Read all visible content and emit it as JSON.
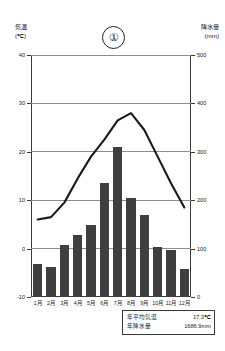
{
  "header": {
    "left_title": "気温",
    "left_unit": "(℃)",
    "right_title": "降水量",
    "right_unit": "(mm)",
    "panel_number": "①"
  },
  "summary": {
    "avg_temp_label": "年平均気温",
    "avg_temp_value": "17.3℃",
    "total_precip_label": "年降水量",
    "total_precip_value": "1686.9mm"
  },
  "colors": {
    "bar": "#3f3f3f",
    "line": "#1a1a1a",
    "grid": "#8d8d8d",
    "axis": "#3a3a3a"
  },
  "chart_data": {
    "type": "bar",
    "title": "①",
    "xlabel": "",
    "categories": [
      "1月",
      "2月",
      "3月",
      "4月",
      "5月",
      "6月",
      "7月",
      "8月",
      "9月",
      "10月",
      "11月",
      "12月"
    ],
    "axes": {
      "left": {
        "label": "気温 (℃)",
        "ticks": [
          -10,
          0,
          10,
          20,
          30,
          40
        ],
        "ticklabels": [
          "-10",
          "0",
          "10",
          "20",
          "30",
          "40"
        ],
        "range": [
          -10,
          40
        ]
      },
      "right": {
        "label": "降水量 (mm)",
        "ticks": [
          0,
          100,
          200,
          300,
          400,
          500
        ],
        "ticklabels": [
          "0",
          "100",
          "200",
          "300",
          "400",
          "500"
        ],
        "range": [
          0,
          500
        ]
      }
    },
    "grid": true,
    "legend": "none",
    "series": [
      {
        "name": "降水量",
        "type": "bar",
        "axis": "right",
        "unit": "mm",
        "values": [
          68,
          62,
          108,
          128,
          148,
          235,
          310,
          205,
          170,
          103,
          98,
          58
        ]
      },
      {
        "name": "気温",
        "type": "line",
        "axis": "left",
        "unit": "℃",
        "values": [
          6.0,
          6.5,
          9.5,
          14.5,
          19.0,
          22.5,
          26.5,
          28.0,
          24.5,
          19.0,
          13.5,
          8.5
        ]
      }
    ]
  }
}
